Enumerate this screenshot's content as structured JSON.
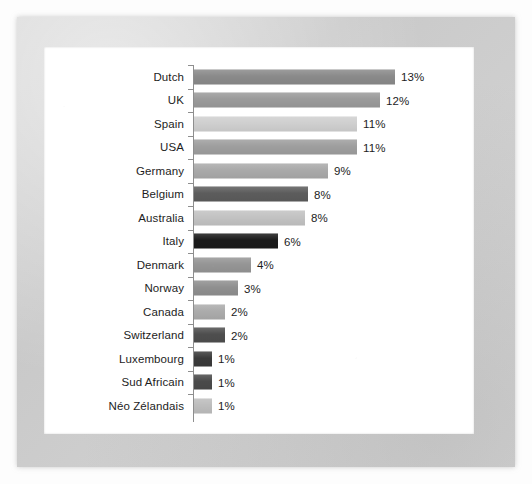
{
  "chart_data": {
    "type": "bar",
    "orientation": "horizontal",
    "title": "",
    "subtitle": "",
    "xlabel": "",
    "ylabel": "",
    "grid": false,
    "legend": "none",
    "axis_line": true,
    "xlim": [
      0,
      13
    ],
    "value_suffix": "%",
    "categories": [
      "Dutch",
      "UK",
      "Spain",
      "USA",
      "Germany",
      "Belgium",
      "Australia",
      "Italy",
      "Denmark",
      "Norway",
      "Canada",
      "Switzerland",
      "Luxembourg",
      "Sud Africain",
      "Néo Zélandais"
    ],
    "values": [
      13,
      12,
      11,
      11,
      9,
      8,
      8,
      6,
      4,
      3,
      2,
      2,
      1,
      1,
      1
    ],
    "value_labels": [
      "13%",
      "12%",
      "11%",
      "11%",
      "9%",
      "8%",
      "8%",
      "6%",
      "4%",
      "3%",
      "2%",
      "2%",
      "1%",
      "1%",
      "1%"
    ],
    "bar_colors": [
      "#8a8a8a",
      "#9a9a9a",
      "#cfcfcf",
      "#9e9e9e",
      "#a9a9a9",
      "#5c5c5c",
      "#c2c2c2",
      "#1a1a1a",
      "#959595",
      "#8f8f8f",
      "#ababab",
      "#4e4e4e",
      "#3a3a3a",
      "#4a4a4a",
      "#bdbdbd"
    ],
    "bar_pixel_widths": [
      201,
      186,
      163,
      163,
      134,
      114,
      111,
      84,
      57,
      44,
      31,
      31,
      18,
      18,
      18
    ]
  },
  "colors": {
    "frame": "#d2d2d2",
    "canvas": "#ffffff",
    "axis": "#8e8e8e",
    "text": "#1d1d1d"
  }
}
